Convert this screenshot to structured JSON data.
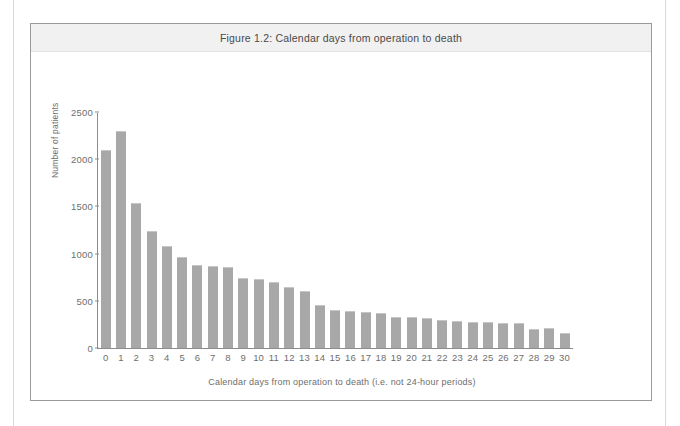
{
  "figure": {
    "title": "Figure 1.2: Calendar days from operation to death"
  },
  "chart_data": {
    "type": "bar",
    "title": "Figure 1.2: Calendar days from operation to death",
    "xlabel": "Calendar days from operation to death (i.e. not 24-hour periods)",
    "ylabel": "Number of patients",
    "categories": [
      "0",
      "1",
      "2",
      "3",
      "4",
      "5",
      "6",
      "7",
      "8",
      "9",
      "10",
      "11",
      "12",
      "13",
      "14",
      "15",
      "16",
      "17",
      "18",
      "19",
      "20",
      "21",
      "22",
      "23",
      "24",
      "25",
      "26",
      "27",
      "28",
      "29",
      "30"
    ],
    "values": [
      2100,
      2300,
      1540,
      1240,
      1080,
      960,
      880,
      870,
      860,
      740,
      730,
      700,
      650,
      600,
      460,
      400,
      390,
      380,
      375,
      330,
      330,
      320,
      300,
      290,
      280,
      275,
      270,
      265,
      200,
      215,
      155
    ],
    "ylim": [
      0,
      2500
    ],
    "yticks": [
      0,
      500,
      1000,
      1500,
      2000,
      2500
    ],
    "ytick_labels": [
      "0",
      "500",
      "1000",
      "1500",
      "2000",
      "2500"
    ],
    "grid": false,
    "legend": null,
    "bar_color": "#a8a8a8",
    "axis_color": "#8d8d8d",
    "text_color": "#6e6e6e"
  }
}
